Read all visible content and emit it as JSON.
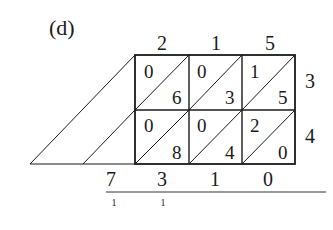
{
  "label": "(d)",
  "multiplicand_digits": [
    "2",
    "1",
    "5"
  ],
  "multiplier_digits": [
    "3",
    "4"
  ],
  "cells": [
    [
      {
        "tens": "0",
        "ones": "6"
      },
      {
        "tens": "0",
        "ones": "3"
      },
      {
        "tens": "1",
        "ones": "5"
      }
    ],
    [
      {
        "tens": "0",
        "ones": "8"
      },
      {
        "tens": "0",
        "ones": "4"
      },
      {
        "tens": "2",
        "ones": "0"
      }
    ]
  ],
  "result_digits": [
    "7",
    "3",
    "1",
    "0"
  ],
  "carries": [
    "1",
    "1"
  ],
  "colors": {
    "ink": "#1a1a1a",
    "background": "#ffffff"
  }
}
